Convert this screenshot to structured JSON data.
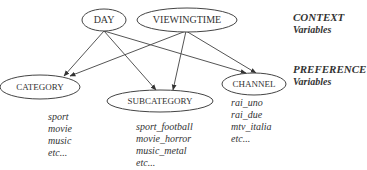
{
  "legend": {
    "context": {
      "title": "CONTEXT",
      "subtitle": "Variables"
    },
    "preference": {
      "title": "PREFERENCE",
      "subtitle": "Variables"
    }
  },
  "nodes": {
    "day": {
      "label": "DAY",
      "group": "context"
    },
    "viewingtime": {
      "label": "VIEWINGTIME",
      "group": "context"
    },
    "category": {
      "label": "CATEGORY",
      "group": "preference",
      "values": [
        "sport",
        "movie",
        "music",
        "etc..."
      ]
    },
    "subcategory": {
      "label": "SUBCATEGORY",
      "group": "preference",
      "values": [
        "sport_football",
        "movie_horror",
        "music_metal",
        "etc..."
      ]
    },
    "channel": {
      "label": "CHANNEL",
      "group": "preference",
      "values": [
        "rai_uno",
        "rai_due",
        "mtv_italia",
        "etc..."
      ]
    }
  },
  "edges": [
    {
      "from": "DAY",
      "to": "CATEGORY"
    },
    {
      "from": "DAY",
      "to": "SUBCATEGORY"
    },
    {
      "from": "DAY",
      "to": "CHANNEL"
    },
    {
      "from": "VIEWINGTIME",
      "to": "CATEGORY"
    },
    {
      "from": "VIEWINGTIME",
      "to": "SUBCATEGORY"
    },
    {
      "from": "VIEWINGTIME",
      "to": "CHANNEL"
    }
  ],
  "colors": {
    "stroke": "#444444",
    "text": "#333333",
    "background": "#ffffff"
  }
}
